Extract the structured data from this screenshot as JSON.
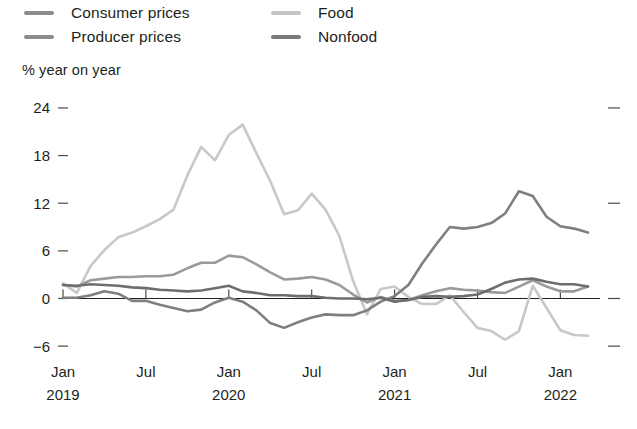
{
  "legend": {
    "items": [
      {
        "label": "Consumer prices",
        "color": "#8c8c8c",
        "col": "a",
        "row": 1,
        "swatch": "line-swatch"
      },
      {
        "label": "Producer prices",
        "color": "#8c8c8c",
        "col": "a",
        "row": 2,
        "swatch": "line-swatch"
      },
      {
        "label": "Food",
        "color": "#c4c4c4",
        "col": "b",
        "row": 1,
        "swatch": "line-swatch"
      },
      {
        "label": "Nonfood",
        "color": "#7a7a7a",
        "col": "b",
        "row": 2,
        "swatch": "line-swatch"
      }
    ]
  },
  "axis_title": "% year on year",
  "chart_data": {
    "type": "line",
    "title": "",
    "subtitle": "",
    "xlabel": "",
    "ylabel": "% year on year",
    "ylim": [
      -8,
      25
    ],
    "yticks": [
      24,
      18,
      12,
      6,
      0,
      -6
    ],
    "ytick_labels": [
      "24",
      "18",
      "12",
      "6",
      "0",
      "-6"
    ],
    "grid": false,
    "zero_line": true,
    "legend_position": "top",
    "x_tick_labels": [
      {
        "month": "Jan",
        "year": "2019",
        "index": 0
      },
      {
        "month": "Jul",
        "year": "",
        "index": 6
      },
      {
        "month": "Jan",
        "year": "2020",
        "index": 12
      },
      {
        "month": "Jul",
        "year": "",
        "index": 18
      },
      {
        "month": "Jan",
        "year": "2021",
        "index": 24
      },
      {
        "month": "Jul",
        "year": "",
        "index": 30
      },
      {
        "month": "Jan",
        "year": "2022",
        "index": 36
      }
    ],
    "x": [
      "2019-01",
      "2019-02",
      "2019-03",
      "2019-04",
      "2019-05",
      "2019-06",
      "2019-07",
      "2019-08",
      "2019-09",
      "2019-10",
      "2019-11",
      "2019-12",
      "2020-01",
      "2020-02",
      "2020-03",
      "2020-04",
      "2020-05",
      "2020-06",
      "2020-07",
      "2020-08",
      "2020-09",
      "2020-10",
      "2020-11",
      "2020-12",
      "2021-01",
      "2021-02",
      "2021-03",
      "2021-04",
      "2021-05",
      "2021-06",
      "2021-07",
      "2021-08",
      "2021-09",
      "2021-10",
      "2021-11",
      "2021-12",
      "2022-01",
      "2022-02",
      "2022-03"
    ],
    "series": [
      {
        "name": "Consumer prices",
        "color": "#9a9a9a",
        "values": [
          1.7,
          1.5,
          2.3,
          2.5,
          2.7,
          2.7,
          2.8,
          2.8,
          3.0,
          3.8,
          4.5,
          4.5,
          5.4,
          5.2,
          4.3,
          3.3,
          2.4,
          2.5,
          2.7,
          2.4,
          1.7,
          0.5,
          -0.5,
          0.2,
          -0.3,
          -0.2,
          0.4,
          0.9,
          1.3,
          1.1,
          1.0,
          0.8,
          0.7,
          1.5,
          2.3,
          1.5,
          0.9,
          0.9,
          1.5
        ]
      },
      {
        "name": "Producer prices",
        "color": "#7f7f7f",
        "values": [
          0.1,
          0.1,
          0.4,
          0.9,
          0.6,
          -0.3,
          -0.3,
          -0.8,
          -1.2,
          -1.6,
          -1.4,
          -0.5,
          0.1,
          -0.4,
          -1.5,
          -3.1,
          -3.7,
          -3.0,
          -2.4,
          -2.0,
          -2.1,
          -2.1,
          -1.5,
          -0.4,
          0.3,
          1.7,
          4.4,
          6.8,
          9.0,
          8.8,
          9.0,
          9.5,
          10.7,
          13.5,
          12.9,
          10.3,
          9.1,
          8.8,
          8.3
        ]
      },
      {
        "name": "Food",
        "color": "#c8c8c8",
        "values": [
          1.9,
          0.7,
          4.1,
          6.1,
          7.7,
          8.3,
          9.1,
          10.0,
          11.2,
          15.5,
          19.1,
          17.4,
          20.6,
          21.9,
          18.3,
          14.8,
          10.6,
          11.1,
          13.2,
          11.2,
          7.9,
          2.2,
          -2.0,
          1.2,
          1.5,
          0.2,
          -0.7,
          -0.7,
          0.4,
          -1.7,
          -3.7,
          -4.1,
          -5.2,
          -4.1,
          1.6,
          -1.2,
          -4.0,
          -4.6,
          -4.7
        ]
      },
      {
        "name": "Nonfood",
        "color": "#6e6e6e",
        "values": [
          1.7,
          1.6,
          1.8,
          1.7,
          1.6,
          1.4,
          1.3,
          1.1,
          1.0,
          0.9,
          1.0,
          1.3,
          1.6,
          0.9,
          0.7,
          0.4,
          0.4,
          0.3,
          0.3,
          0.1,
          0.0,
          0.0,
          -0.1,
          0.1,
          -0.4,
          -0.2,
          0.2,
          0.3,
          0.2,
          0.3,
          0.5,
          1.2,
          2.0,
          2.4,
          2.5,
          2.1,
          1.8,
          1.8,
          1.5
        ]
      }
    ],
    "annotations": []
  }
}
